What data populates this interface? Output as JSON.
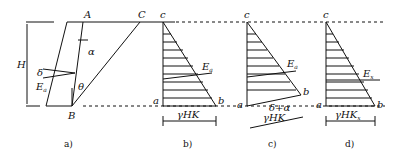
{
  "diagram": {
    "type": "retaining-wall earth pressure diagrams",
    "panels": [
      {
        "id": "a",
        "caption": "a)",
        "labels": {
          "top_left": "A",
          "top_right": "C",
          "bottom": "B",
          "height": "H",
          "wall_angle": "α",
          "wedge_angle": "θ",
          "friction": "δ",
          "force": "E",
          "force_sub": "a"
        }
      },
      {
        "id": "b",
        "caption": "b)",
        "labels": {
          "top": "c",
          "bottom_left": "a",
          "bottom_right": "b",
          "force": "E",
          "force_sub": "a",
          "width": "γHK"
        }
      },
      {
        "id": "c",
        "caption": "c)",
        "labels": {
          "top": "c",
          "bottom_left": "a",
          "bottom_right": "b",
          "force": "E",
          "force_sub": "a",
          "angle": "δ+α",
          "width": "γHK"
        }
      },
      {
        "id": "d",
        "caption": "d)",
        "labels": {
          "top": "c",
          "bottom_left": "a",
          "bottom_right": "b",
          "force": "E",
          "force_sub": "x",
          "width": "γHK",
          "width_sub": "x"
        }
      }
    ],
    "colors": {
      "line": "#111111",
      "background": "#ffffff"
    }
  }
}
